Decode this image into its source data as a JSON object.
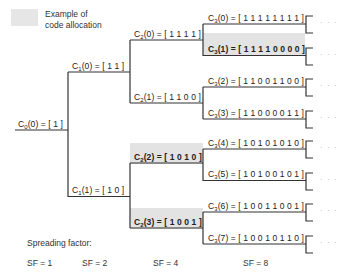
{
  "legend": {
    "swatch_color": "#e6e6e6",
    "text_line1": "Example of",
    "text_line2": "code allocation"
  },
  "nodes": {
    "c0_0": {
      "prefix": "C",
      "sub": "0",
      "suffix": "(0) = [ 1 ]",
      "highlighted": false
    },
    "c1_0": {
      "prefix": "C",
      "sub": "1",
      "suffix": "(0) = [ 1 1 ]",
      "highlighted": false
    },
    "c1_1": {
      "prefix": "C",
      "sub": "1",
      "suffix": "(1) = [ 1 0 ]",
      "highlighted": false
    },
    "c2_0": {
      "prefix": "C",
      "sub": "2",
      "suffix": "(0) = [ 1 1 1 1 ]",
      "highlighted": false
    },
    "c2_1": {
      "prefix": "C",
      "sub": "2",
      "suffix": "(1) = [ 1 1 0 0 ]",
      "highlighted": false
    },
    "c2_2": {
      "prefix": "C",
      "sub": "2",
      "suffix": "(2) = [ 1 0 1 0 ]",
      "highlighted": true
    },
    "c2_3": {
      "prefix": "C",
      "sub": "2",
      "suffix": "(3) = [ 1 0 0 1 ]",
      "highlighted": true
    },
    "c3_0": {
      "prefix": "C",
      "sub": "3",
      "suffix": "(0) = [ 1 1 1 1 1 1 1 1 ]",
      "highlighted": false
    },
    "c3_1": {
      "prefix": "C",
      "sub": "3",
      "suffix": "(1) = [ 1 1 1 1 0 0 0 0 ]",
      "highlighted": true
    },
    "c3_2": {
      "prefix": "C",
      "sub": "3",
      "suffix": "(2) = [ 1 1 0 0 1 1 0 0 ]",
      "highlighted": false
    },
    "c3_3": {
      "prefix": "C",
      "sub": "3",
      "suffix": "(3) = [ 1 1 0 0 0 0 1 1 ]",
      "highlighted": false
    },
    "c3_4": {
      "prefix": "C",
      "sub": "3",
      "suffix": "(4) = [ 1 0 1 0 1 0 1 0 ]",
      "highlighted": false
    },
    "c3_5": {
      "prefix": "C",
      "sub": "3",
      "suffix": "(5) = [ 1 0 1 0 0 1 0 1 ]",
      "highlighted": false
    },
    "c3_6": {
      "prefix": "C",
      "sub": "3",
      "suffix": "(6) = [ 1 0 0 1 1 0 0 1 ]",
      "highlighted": false
    },
    "c3_7": {
      "prefix": "C",
      "sub": "3",
      "suffix": "(7) = [ 1 0 0 1 0 1 1 0 ]",
      "highlighted": false
    }
  },
  "continuation": "· · ·",
  "footer": {
    "title": "Spreading factor:",
    "sf": [
      "SF = 1",
      "SF = 2",
      "SF = 4",
      "SF = 8"
    ]
  },
  "colors": {
    "line": "#333333",
    "highlight": "#e3e3e3",
    "ellipsis": "#aaaaaa"
  }
}
